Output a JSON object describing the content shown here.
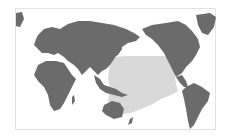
{
  "map": {
    "projection": "pacific-centered world map",
    "colors": {
      "land": "#6b6b6b",
      "highlight_region": "#d9d9d9",
      "ocean": "#ffffff",
      "frame_border": "#e2e2e2"
    },
    "highlight": {
      "label": "",
      "description": "Shaded region covering western and central Pacific Ocean, from East Asia / Philippines east toward mid-Pacific, south to Melanesia/Polynesia"
    },
    "regions_visible": [
      "Europe",
      "Africa",
      "Asia",
      "Australia",
      "North America",
      "South America",
      "Greenland"
    ]
  }
}
